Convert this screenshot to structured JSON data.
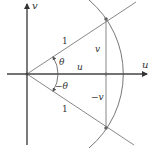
{
  "diagram": {
    "title": "",
    "axes": {
      "horizontal_label": "u",
      "vertical_label": "v"
    },
    "labels": {
      "upper_radius": "1",
      "lower_radius": "1",
      "upper_height": "v",
      "lower_height": "−v",
      "angle_positive": "θ",
      "angle_negative": "−θ",
      "base_length": "u"
    },
    "colors": {
      "axis": "#333333",
      "line": "#777777",
      "text": "#333333"
    }
  }
}
